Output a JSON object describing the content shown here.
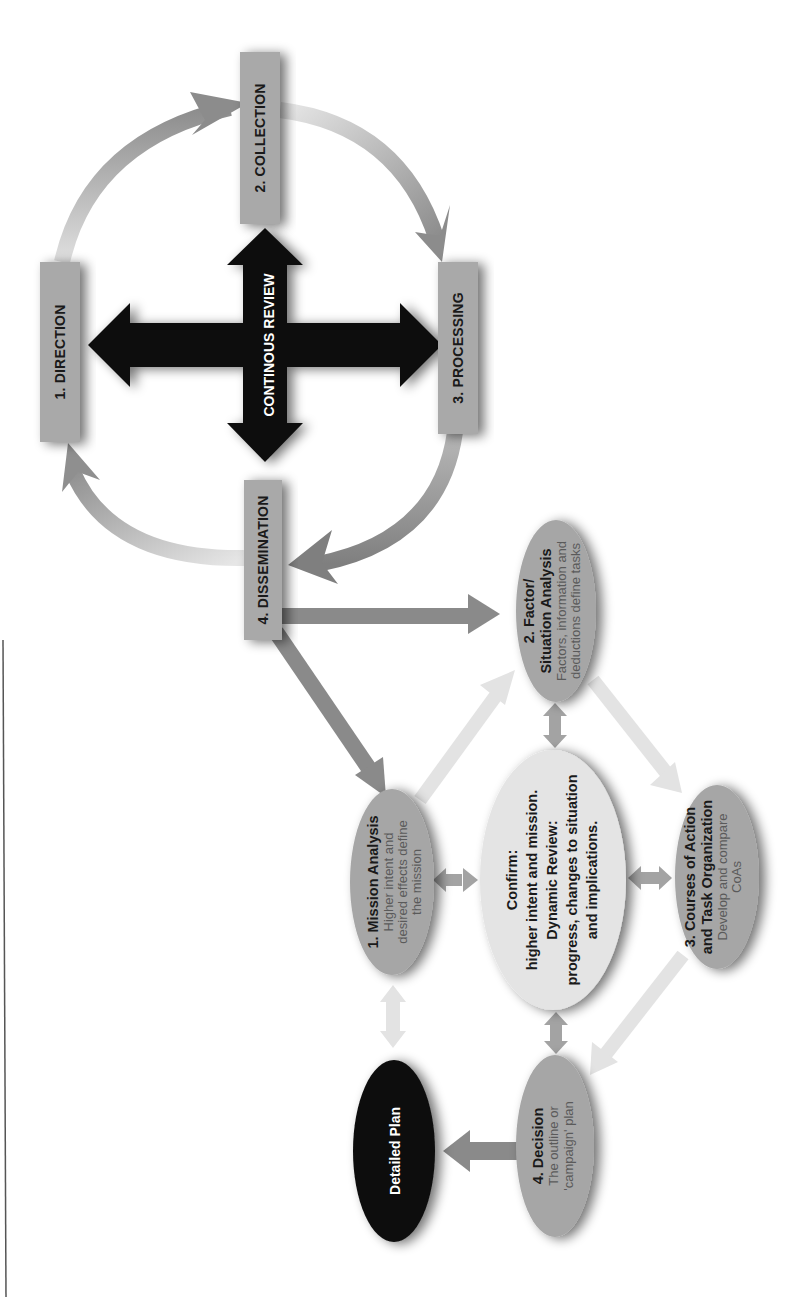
{
  "diagram": {
    "orientation": "rotated 90 degrees counter-clockwise",
    "cycle": {
      "steps": [
        {
          "id": "direction",
          "label": "1. DIRECTION"
        },
        {
          "id": "collection",
          "label": "2. COLLECTION"
        },
        {
          "id": "processing",
          "label": "3. PROCESSING"
        },
        {
          "id": "dissemination",
          "label": "4. DISSEMINATION"
        }
      ],
      "center_label": "CONTINOUS REVIEW"
    },
    "planning": {
      "mission": {
        "title": "1. Mission Analysis",
        "sub": [
          "Higher intent and",
          "desired effects define",
          "the mission"
        ]
      },
      "factor": {
        "title": [
          "2. Factor/",
          "Situation Analysis"
        ],
        "sub": [
          "Factors, information and",
          "deductions define tasks"
        ]
      },
      "courses": {
        "title": [
          "3. Courses of Action",
          "and Task Organization"
        ],
        "sub": [
          "Develop and compare",
          "CoAs"
        ]
      },
      "decision": {
        "title": "4. Decision",
        "sub": [
          "The outline or",
          "'campaign' plan"
        ]
      },
      "center": {
        "lines": [
          "Confirm:",
          "higher intent and mission.",
          "Dynamic Review:",
          "progress, changes to situation",
          "and implications."
        ]
      },
      "detailed_plan": {
        "label": "Detailed Plan"
      }
    },
    "colors": {
      "box": "#a9a9a9",
      "ellipse": "#a6a6a6",
      "center_ellipse": "#e4e4e4",
      "dark": "#111111",
      "arrow_dark": "#8a8a8a",
      "arrow_light": "#dcdcdc"
    }
  }
}
